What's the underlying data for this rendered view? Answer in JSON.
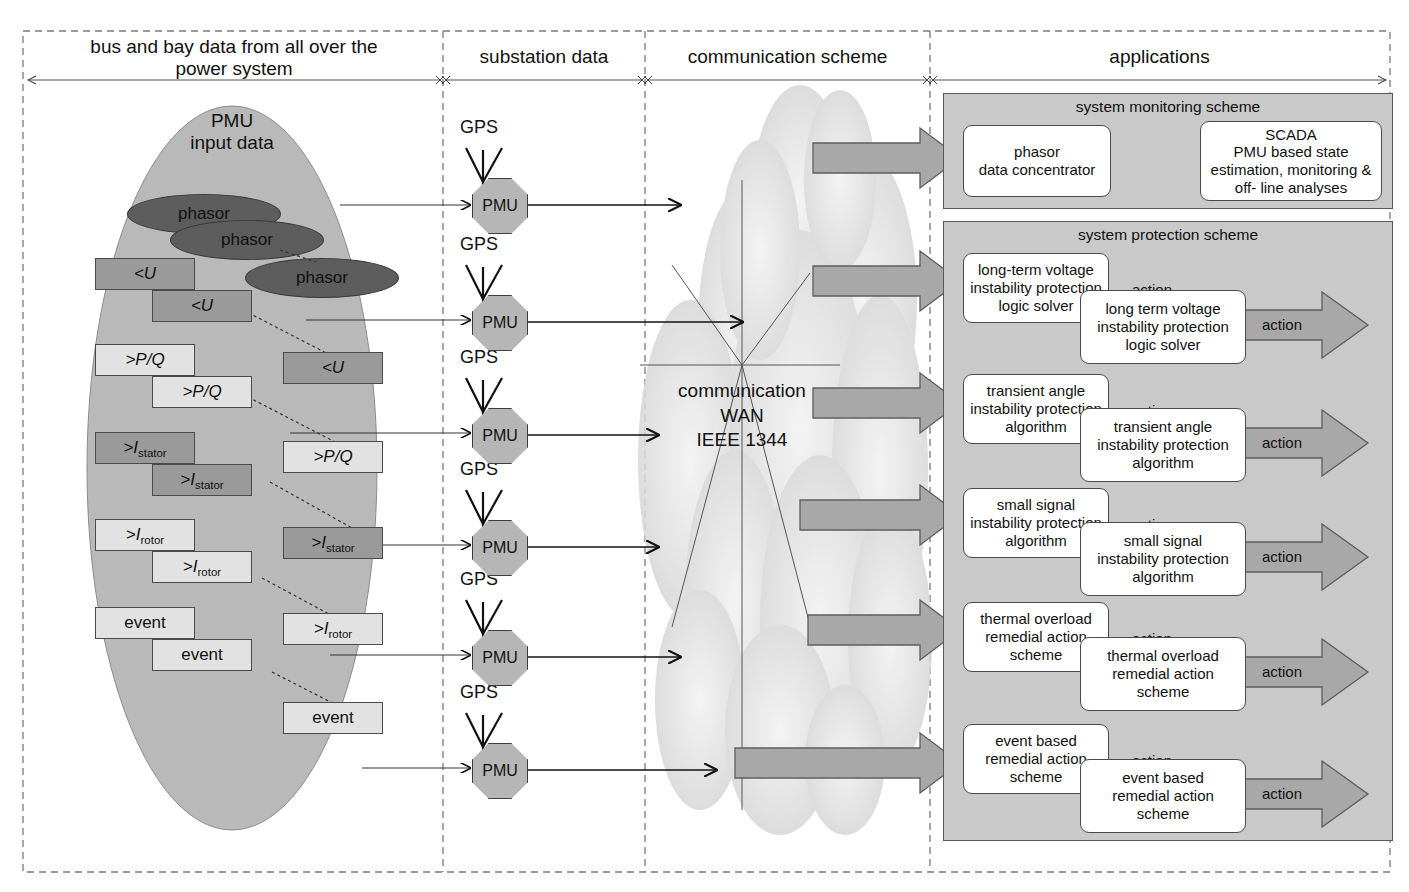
{
  "columns": [
    {
      "id": "col1",
      "label": "bus and bay data from all over the\npower system"
    },
    {
      "id": "col2",
      "label": "substation data"
    },
    {
      "id": "col3",
      "label": "communication scheme"
    },
    {
      "id": "col4",
      "label": "applications"
    }
  ],
  "source": {
    "ellipse_title_line1": "PMU",
    "ellipse_title_line2": "input data",
    "phasors": [
      "phasor",
      "phasor",
      "phasor"
    ],
    "signal_groups": [
      {
        "name": "voltage",
        "labels": [
          "<U",
          "<U",
          "<U"
        ]
      },
      {
        "name": "power",
        "labels": [
          ">P/Q",
          ">P/Q",
          ">P/Q"
        ]
      },
      {
        "name": "stator-current",
        "labels": [
          ">I",
          "stator"
        ]
      },
      {
        "name": "rotor-current",
        "labels": [
          ">I",
          "rotor"
        ]
      },
      {
        "name": "event",
        "labels": [
          "event",
          "event",
          "event"
        ]
      }
    ],
    "boxes": [
      {
        "text": "<U",
        "sub": "",
        "shade": "dark"
      },
      {
        "text": "<U",
        "sub": "",
        "shade": "dark"
      },
      {
        "text": "<U",
        "sub": "",
        "shade": "dark"
      },
      {
        "text": ">P/Q",
        "sub": "",
        "shade": "light"
      },
      {
        "text": ">P/Q",
        "sub": "",
        "shade": "light"
      },
      {
        "text": ">P/Q",
        "sub": "",
        "shade": "light"
      },
      {
        "text": ">I",
        "sub": "stator",
        "shade": "dark"
      },
      {
        "text": ">I",
        "sub": "stator",
        "shade": "dark"
      },
      {
        "text": ">I",
        "sub": "stator",
        "shade": "dark"
      },
      {
        "text": ">I",
        "sub": "rotor",
        "shade": "light"
      },
      {
        "text": ">I",
        "sub": "rotor",
        "shade": "light"
      },
      {
        "text": ">I",
        "sub": "rotor",
        "shade": "light"
      },
      {
        "text": "event",
        "sub": "",
        "shade": "light"
      },
      {
        "text": "event",
        "sub": "",
        "shade": "light"
      },
      {
        "text": "event",
        "sub": "",
        "shade": "light"
      }
    ]
  },
  "substation": {
    "gps_label": "GPS",
    "pmu_label": "PMU",
    "count": 6
  },
  "communication": {
    "line1": "communication",
    "line2": "WAN",
    "line3": "IEEE 1344"
  },
  "monitoring": {
    "title": "system monitoring scheme",
    "concentrator": "phasor\ndata concentrator",
    "scada": "SCADA\nPMU based state\nestimation, monitoring &\noff- line analyses"
  },
  "protection": {
    "title": "system protection scheme",
    "action_label": "action",
    "schemes": [
      {
        "back": "long-term voltage\ninstability protection\nlogic solver",
        "front": "long term voltage\ninstability protection\nlogic solver"
      },
      {
        "back": "transient angle\ninstability protection\nalgorithm",
        "front": "transient angle\ninstability protection\nalgorithm"
      },
      {
        "back": "small signal\ninstability protection\nalgorithm",
        "front": "small signal\ninstability protection\nalgorithm"
      },
      {
        "back": "thermal overload\nremedial action\nscheme",
        "front": "thermal overload\nremedial action\nscheme"
      },
      {
        "back": "event based\nremedial action\nscheme",
        "front": "event based\nremedial action\nscheme"
      }
    ]
  },
  "colors": {
    "ellipse_fill": "#b9b9b9",
    "panel_fill": "#c9c9c9",
    "arrow_fill": "#a8a8a8",
    "phasor_fill": "#5d5d5d",
    "box_dark": "#9a9a9a",
    "box_light": "#e2e2e2",
    "cloud": "#d6d6d6",
    "outline": "#4a4a4a"
  }
}
